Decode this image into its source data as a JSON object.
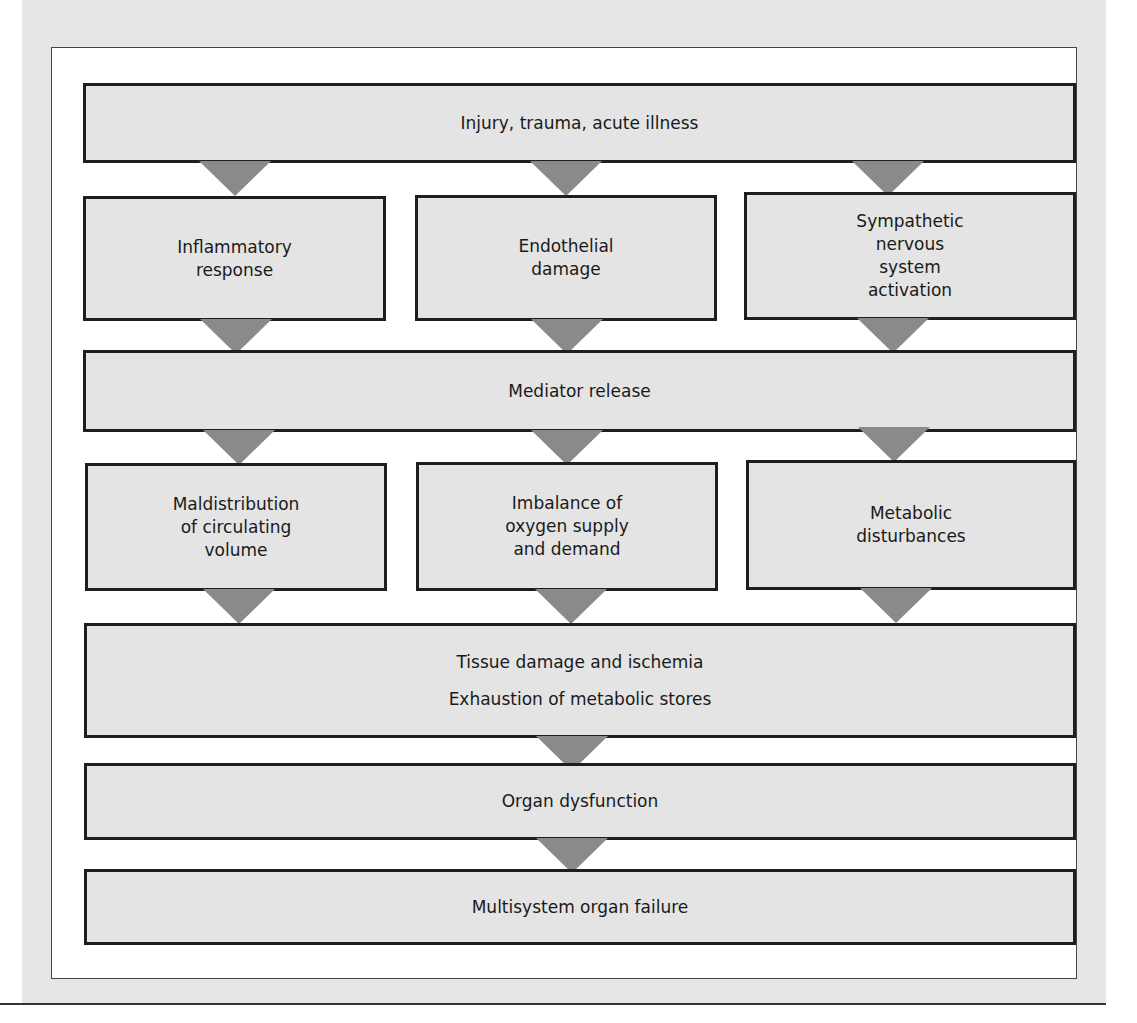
{
  "diagram": {
    "type": "flowchart",
    "colors": {
      "box_fill": "#e4e4e4",
      "box_border": "#1e1e1e",
      "arrow": "#8a8a8a",
      "page_background": "#e6e6e6",
      "panel_background": "#ffffff"
    },
    "nodes": {
      "injury": {
        "lines": [
          "Injury, trauma, acute illness"
        ]
      },
      "inflammatory": {
        "lines": [
          "Inflammatory",
          "response"
        ]
      },
      "endothelial": {
        "lines": [
          "Endothelial",
          "damage"
        ]
      },
      "sympathetic": {
        "lines": [
          "Sympathetic",
          "nervous",
          "system",
          "activation"
        ]
      },
      "mediator": {
        "lines": [
          "Mediator release"
        ]
      },
      "maldistribution": {
        "lines": [
          "Maldistribution",
          "of circulating",
          "volume"
        ]
      },
      "imbalance": {
        "lines": [
          "Imbalance of",
          "oxygen supply",
          "and demand"
        ]
      },
      "metabolic": {
        "lines": [
          "Metabolic",
          "disturbances"
        ]
      },
      "tissue": {
        "lines": [
          "Tissue damage and ischemia",
          "Exhaustion of metabolic stores"
        ]
      },
      "organ_dysfunction": {
        "lines": [
          "Organ dysfunction"
        ]
      },
      "mods": {
        "lines": [
          "Multisystem organ failure"
        ]
      }
    },
    "edges": [
      [
        "injury",
        "inflammatory"
      ],
      [
        "injury",
        "endothelial"
      ],
      [
        "injury",
        "sympathetic"
      ],
      [
        "inflammatory",
        "mediator"
      ],
      [
        "endothelial",
        "mediator"
      ],
      [
        "sympathetic",
        "mediator"
      ],
      [
        "mediator",
        "maldistribution"
      ],
      [
        "mediator",
        "imbalance"
      ],
      [
        "mediator",
        "metabolic"
      ],
      [
        "maldistribution",
        "tissue"
      ],
      [
        "imbalance",
        "tissue"
      ],
      [
        "metabolic",
        "tissue"
      ],
      [
        "tissue",
        "organ_dysfunction"
      ],
      [
        "organ_dysfunction",
        "mods"
      ]
    ]
  }
}
